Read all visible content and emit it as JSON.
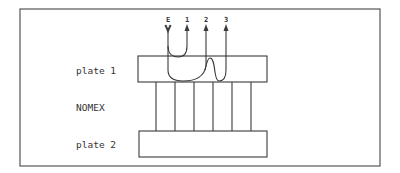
{
  "diagram": {
    "labels": {
      "plate1": "plate 1",
      "nomex": "NOMEX",
      "plate2": "plate 2"
    },
    "terminals": [
      {
        "id": "E",
        "label": "E",
        "direction": "in"
      },
      {
        "id": "1",
        "label": "1",
        "direction": "out"
      },
      {
        "id": "2",
        "label": "2",
        "direction": "out"
      },
      {
        "id": "3",
        "label": "3",
        "direction": "out"
      }
    ],
    "nomex_strands": 6,
    "colors": {
      "line": "#3a3a3a",
      "frame": "#555555",
      "background": "#ffffff"
    }
  }
}
